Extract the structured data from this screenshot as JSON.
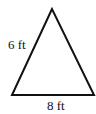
{
  "diagram": {
    "shape": "triangle",
    "side_label": "6 ft",
    "base_label": "8 ft",
    "stroke_color": "#111111",
    "vertices": {
      "apex": [
        52,
        9
      ],
      "bottom_left": [
        12,
        95
      ],
      "bottom_right": [
        94,
        95
      ]
    }
  }
}
